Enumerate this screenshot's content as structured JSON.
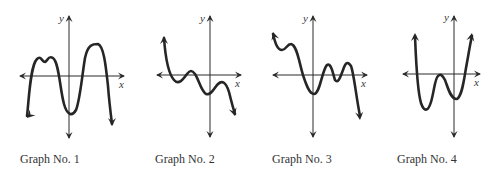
{
  "figure": {
    "colors": {
      "axis": "#2a2a2a",
      "curve": "#262626",
      "text": "#333333",
      "background": "#ffffff"
    },
    "graphs": [
      {
        "caption": "Graph No. 1",
        "caption_pos": [
          20,
          152
        ],
        "origin": [
          69,
          76
        ],
        "x_axis": [
          20,
          124
        ],
        "y_axis": [
          16,
          138
        ],
        "x_label": "x",
        "y_label": "y",
        "x_label_pos": [
          119,
          88
        ],
        "y_label_pos": [
          59,
          22
        ],
        "curve": "M27,116 C29,100 30,66 37,59 C41,55 42,62 45,62 C48,61 48,55 53,58 C59,62 60,90 64,104 C67,115 72,117 76,110 C80,100 82,76 85,58 C88,44 93,44 98,44 C104,46 106,68 108,86 C109,100 111,116 112,124",
        "start_arrow": [
          27,
          118,
          -1,
          1
        ],
        "end_arrow": [
          112,
          126,
          0,
          1
        ]
      },
      {
        "caption": "Graph No. 2",
        "caption_pos": [
          155,
          152
        ],
        "origin": [
          210,
          75
        ],
        "x_axis": [
          157,
          241
        ],
        "y_axis": [
          16,
          137
        ],
        "x_label": "x",
        "y_label": "y",
        "x_label_pos": [
          235,
          87
        ],
        "y_label_pos": [
          200,
          22
        ],
        "curve": "M164,38 C165,52 167,72 174,80 C179,86 184,78 187,74 C190,70 192,70 195,74 C199,80 201,91 206,94 C211,96 214,88 218,84 C222,80 226,82 229,92 C231,100 233,108 235,114",
        "start_arrow": [
          164,
          36,
          0,
          -1
        ],
        "end_arrow": [
          235,
          116,
          0.3,
          1
        ]
      },
      {
        "caption": "Graph No. 3",
        "caption_pos": [
          272,
          152
        ],
        "origin": [
          313,
          75
        ],
        "x_axis": [
          273,
          367
        ],
        "y_axis": [
          16,
          137
        ],
        "x_label": "x",
        "y_label": "y",
        "x_label_pos": [
          361,
          87
        ],
        "y_label_pos": [
          303,
          22
        ],
        "curve": "M273,34 C275,42 277,50 282,50 C286,50 287,44 291,44 C297,45 299,62 303,75 C306,84 309,94 314,94 C320,94 322,70 327,65 C331,62 333,74 335,80 C338,84 340,78 343,70 C345,64 347,60 351,66 C354,74 356,96 360,116",
        "start_arrow": [
          273,
          32,
          -0.3,
          -1
        ],
        "end_arrow": [
          360,
          120,
          0.1,
          1
        ]
      },
      {
        "caption": "Graph No. 4",
        "caption_pos": [
          397,
          152
        ],
        "origin": [
          454,
          74
        ],
        "x_axis": [
          403,
          480
        ],
        "y_axis": [
          16,
          137
        ],
        "x_label": "x",
        "y_label": "y",
        "x_label_pos": [
          474,
          86
        ],
        "y_label_pos": [
          444,
          21
        ],
        "curve": "M415,36 C416,60 417,90 421,103 C424,112 428,112 431,102 C434,92 435,78 438,76 C440,74 442,74 445,80 C448,88 451,100 457,99 C462,96 464,80 466,68 C469,52 470,44 472,36",
        "start_arrow": [
          415,
          33,
          0,
          -1
        ],
        "end_arrow": [
          472,
          33,
          0.2,
          -1
        ]
      }
    ]
  }
}
